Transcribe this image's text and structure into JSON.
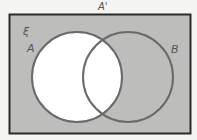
{
  "diagram": {
    "type": "venn",
    "universal_symbol": "ξ",
    "complement_label": "A'",
    "sets": [
      {
        "label": "A",
        "shaded": false
      },
      {
        "label": "B",
        "shaded": true
      }
    ],
    "shaded_region": "A'",
    "colors": {
      "shade": "#bdbdbb",
      "circle_stroke": "#6a6a6a",
      "frame": "#2a2a2a",
      "unshaded": "#ffffff"
    }
  }
}
